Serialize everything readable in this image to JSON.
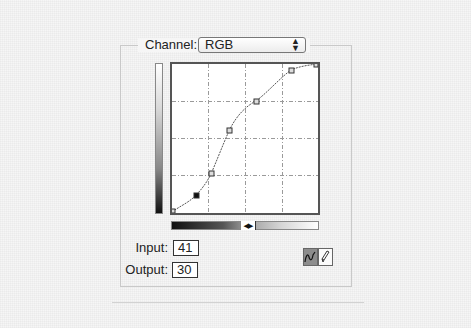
{
  "channel": {
    "label": "Channel:",
    "selected": "RGB",
    "arrows_icon": "up-down-arrows-icon"
  },
  "curve_editor": {
    "grid_divisions": 4,
    "control_points": [
      {
        "input": 0,
        "output": 0
      },
      {
        "input": 41,
        "output": 30
      },
      {
        "input": 67,
        "output": 67
      },
      {
        "input": 98,
        "output": 140
      },
      {
        "input": 145,
        "output": 190
      },
      {
        "input": 204,
        "output": 243
      },
      {
        "input": 255,
        "output": 255
      }
    ],
    "selected_point_index": 1,
    "gradient_toggle_icon": "swap-arrows-icon"
  },
  "fields": {
    "input_label": "Input:",
    "input_value": "41",
    "output_label": "Output:",
    "output_value": "30"
  },
  "tools": {
    "curve_tool": {
      "icon": "curve-tool-icon",
      "active": true
    },
    "pencil_tool": {
      "icon": "pencil-tool-icon",
      "active": false
    }
  },
  "colors": {
    "background": "#f6f6f6",
    "graph_border": "#555555",
    "curve": "#555555",
    "active_tool": "#8c8c8c"
  }
}
